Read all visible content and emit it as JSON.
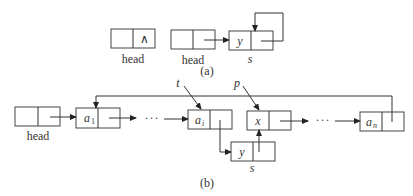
{
  "part_a": {
    "caption": "(a)",
    "empty_list": {
      "label": "head",
      "null_symbol": "∧"
    },
    "single_node_list": {
      "head_label": "head",
      "node_value": "y",
      "node_label": "s"
    }
  },
  "part_b": {
    "caption": "(b)",
    "head_label": "head",
    "nodes": [
      {
        "base": "a",
        "sub": "1"
      },
      {
        "base": "a",
        "sub": "i"
      },
      {
        "base": "x",
        "sub": ""
      },
      {
        "base": "a",
        "sub": "n"
      }
    ],
    "inserted_node": {
      "value": "y",
      "label": "s"
    },
    "pointer_t": "t",
    "pointer_p": "p",
    "ellipsis": "···"
  },
  "colors": {
    "stroke": "#444444",
    "text": "#333333",
    "background": "#ffffff"
  }
}
